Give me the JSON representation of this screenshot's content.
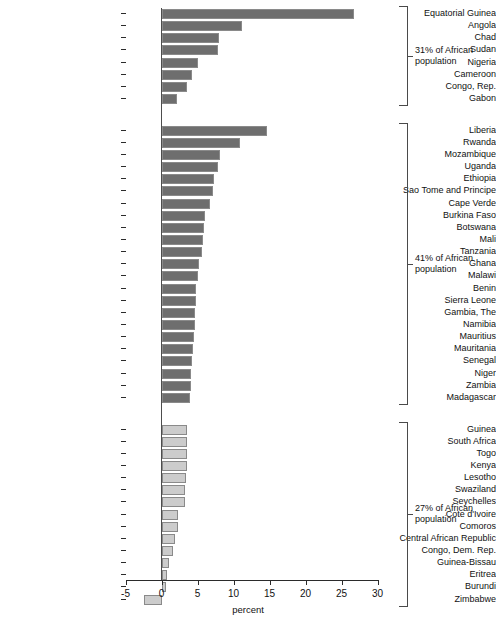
{
  "chart_data": {
    "type": "bar",
    "orientation": "horizontal",
    "title": "",
    "xlabel": "percent",
    "ylabel": "",
    "xlim": [
      -5,
      30
    ],
    "xticks": [
      -5,
      0,
      5,
      10,
      15,
      20,
      25,
      30
    ],
    "xticklabels": [
      "-5",
      "0",
      "5",
      "10",
      "15",
      "20",
      "25",
      "30"
    ],
    "grid": false,
    "legend": null,
    "zero_reference_line": true,
    "groups": [
      {
        "id": "group-1",
        "annotation": "31% of African population",
        "bar_color": "#6e6e6e",
        "categories": [
          "Equatorial Guinea",
          "Angola",
          "Chad",
          "Sudan",
          "Nigeria",
          "Cameroon",
          "Congo, Rep.",
          "Gabon"
        ],
        "values": [
          26.8,
          11.2,
          8.0,
          7.8,
          5.0,
          4.2,
          3.5,
          2.1
        ]
      },
      {
        "id": "group-2",
        "annotation": "41% of African population",
        "bar_color": "#6e6e6e",
        "categories": [
          "Liberia",
          "Rwanda",
          "Mozambique",
          "Uganda",
          "Ethiopia",
          "Sao Tome and Principe",
          "Cape Verde",
          "Burkina Faso",
          "Botswana",
          "Mali",
          "Tanzania",
          "Ghana",
          "Malawi",
          "Benin",
          "Sierra Leone",
          "Gambia, The",
          "Namibia",
          "Mauritius",
          "Mauritania",
          "Senegal",
          "Niger",
          "Zambia",
          "Madagascar"
        ],
        "values": [
          14.7,
          10.9,
          8.1,
          7.9,
          7.3,
          7.2,
          6.7,
          6.1,
          5.9,
          5.7,
          5.6,
          5.2,
          5.1,
          4.8,
          4.8,
          4.7,
          4.6,
          4.5,
          4.4,
          4.3,
          4.1,
          4.1,
          3.9
        ]
      },
      {
        "id": "group-3",
        "annotation": "27% of African population",
        "bar_color": "#cccccc",
        "categories": [
          "Guinea",
          "South Africa",
          "Togo",
          "Kenya",
          "Lesotho",
          "Swaziland",
          "Seychelles",
          "Cote d'Ivoire",
          "Comoros",
          "Central African Republic",
          "Congo, Dem. Rep.",
          "Guinea-Bissau",
          "Eritrea",
          "Burundi",
          "Zimbabwe"
        ],
        "values": [
          3.6,
          3.6,
          3.5,
          3.5,
          3.4,
          3.3,
          3.2,
          2.3,
          2.3,
          1.9,
          1.6,
          1.1,
          0.7,
          0.6,
          -2.5
        ]
      }
    ]
  },
  "colors": {
    "bar_dark": "#6e6e6e",
    "bar_light": "#cccccc",
    "bar_border": "#8a8a8a",
    "axis": "#2b2b2b",
    "text": "#111111"
  }
}
